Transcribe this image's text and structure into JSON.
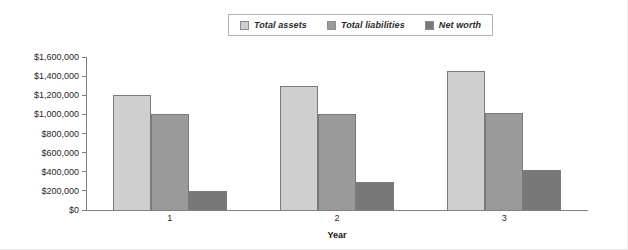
{
  "chart_data": {
    "type": "bar",
    "title": "",
    "xlabel": "Year",
    "ylabel": "",
    "categories": [
      "1",
      "2",
      "3"
    ],
    "series": [
      {
        "name": "Total assets",
        "values": [
          1200000,
          1300000,
          1450000
        ],
        "color": "#cfcfcf"
      },
      {
        "name": "Total liabilities",
        "values": [
          1000000,
          1000000,
          1010000
        ],
        "color": "#9a9a9a"
      },
      {
        "name": "Net worth",
        "values": [
          200000,
          290000,
          420000
        ],
        "color": "#787878"
      }
    ],
    "ylim": [
      0,
      1600000
    ],
    "ytick_labels": [
      "$1,600,000",
      "$1,400,000",
      "$1,200,000",
      "$1,000,000",
      "$800,000",
      "$600,000",
      "$400,000",
      "$200,000",
      "$0"
    ],
    "ytick_values": [
      1600000,
      1400000,
      1200000,
      1000000,
      800000,
      600000,
      400000,
      200000,
      0
    ],
    "grid": false,
    "legend_position": "top-center"
  },
  "legend": {
    "entries": [
      {
        "label": "Total assets",
        "color": "#cfcfcf"
      },
      {
        "label": "Total liabilities",
        "color": "#9a9a9a"
      },
      {
        "label": "Net worth",
        "color": "#787878"
      }
    ]
  },
  "axes": {
    "x_title": "Year",
    "x_categories": [
      "1",
      "2",
      "3"
    ]
  }
}
